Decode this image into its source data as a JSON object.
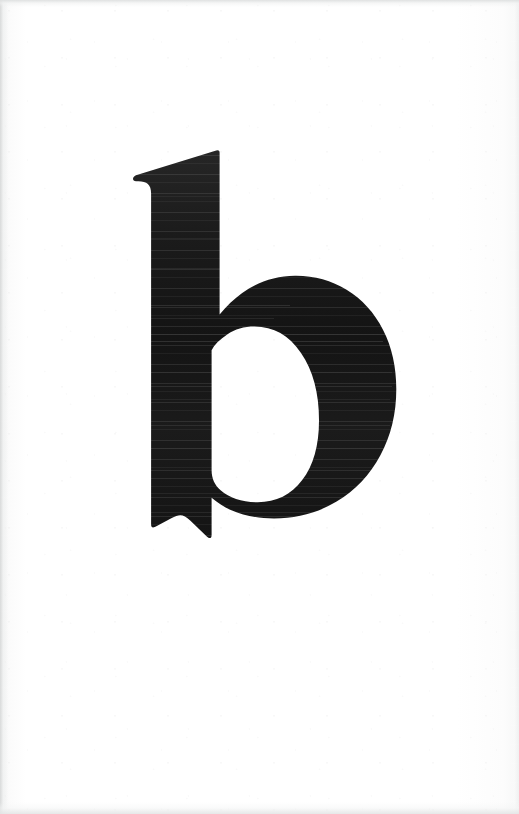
{
  "document": {
    "kind": "scanned-page",
    "page_width": 519,
    "page_height": 814,
    "orientation": "portrait",
    "caption": "",
    "page_number": "",
    "heading": ""
  },
  "specimen": {
    "character": "b",
    "character_name": "lowercase-letter-b",
    "case": "lowercase",
    "script": "Latin",
    "style": "bold serif display letterform",
    "features": [
      "wedge-shaped angled flag at top of ascender",
      "vertical stem",
      "large oval bowl",
      "small left foot spur at baseline"
    ],
    "alt_text": "Large black lowercase letter b printed on a white page"
  },
  "colors": {
    "ink": "#1b1b1b",
    "ink_deep": "#141414",
    "ink_edge": "#262626",
    "paper": "#ffffff",
    "paper_warm": "#fdfdfd",
    "scan_edge": "#e6e7e7",
    "band_highlight": "#4a4a4a"
  },
  "geometry": {
    "glyph_bbox": {
      "x": 133,
      "y": 150,
      "width": 255,
      "height": 398
    },
    "stem": {
      "left": 152,
      "right": 215,
      "top": 178,
      "bottom": 540
    },
    "flag": {
      "apex_x": 218,
      "apex_y": 150,
      "tip_x": 136,
      "tip_y": 180
    },
    "bowl": {
      "left": 152,
      "right": 388,
      "top": 320,
      "bottom": 548
    },
    "counter": {
      "left": 212,
      "right": 312,
      "top": 341,
      "bottom": 517
    }
  },
  "artifacts": {
    "scan_banding": "faint horizontal lighter streaks across the ink",
    "page_edges": "soft gray borders on left, top and bottom margins",
    "grain": "subtle paper speckle"
  }
}
